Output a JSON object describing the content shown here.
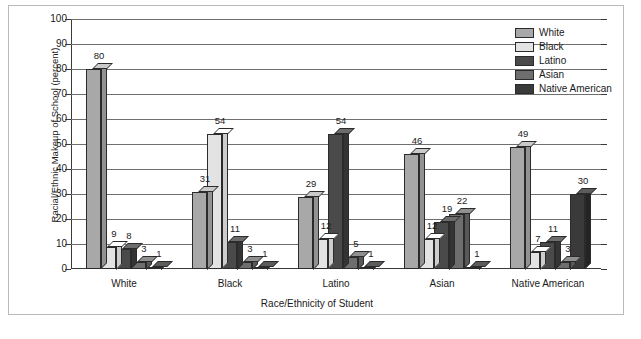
{
  "chart_data": {
    "type": "bar",
    "title": "",
    "xlabel": "Race/Ethnicity of Student",
    "ylabel": "Racial/Ethnic Makeup of School (percent)",
    "categories": [
      "White",
      "Black",
      "Latino",
      "Asian",
      "Native American"
    ],
    "series": [
      {
        "name": "White",
        "color": "#a8a8a8",
        "values": [
          80,
          31,
          29,
          46,
          49
        ]
      },
      {
        "name": "Black",
        "color": "#e3e3e3",
        "values": [
          9,
          54,
          12,
          12,
          7
        ]
      },
      {
        "name": "Latino",
        "color": "#4a4a4a",
        "values": [
          8,
          11,
          54,
          19,
          11
        ]
      },
      {
        "name": "Asian",
        "color": "#6e6e6e",
        "values": [
          3,
          3,
          5,
          22,
          3
        ]
      },
      {
        "name": "Native American",
        "color": "#3a3a3a",
        "values": [
          1,
          1,
          1,
          1,
          30
        ]
      }
    ],
    "ylim": [
      0,
      100
    ],
    "ytick_labels": [
      "0",
      "10",
      "20",
      "30",
      "40",
      "50",
      "60",
      "70",
      "80",
      "90",
      "100"
    ],
    "ytick_step": 10,
    "grid": true,
    "legend_position": "top-right",
    "bar_style": "3d"
  },
  "legend": {
    "items": [
      {
        "label": "White"
      },
      {
        "label": "Black"
      },
      {
        "label": "Latino"
      },
      {
        "label": "Asian"
      },
      {
        "label": "Native American"
      }
    ]
  },
  "caption": {
    "text": ""
  }
}
